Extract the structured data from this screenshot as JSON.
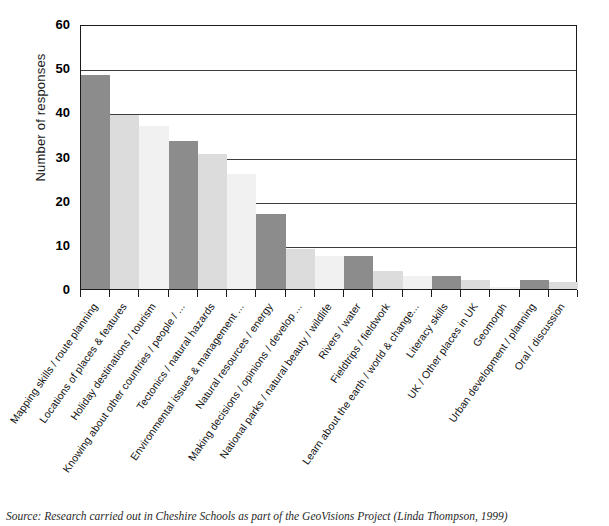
{
  "chart_data": {
    "type": "bar",
    "title": "",
    "xlabel": "",
    "ylabel": "Number of responses",
    "ylim": [
      0,
      60
    ],
    "yticks": [
      0,
      10,
      20,
      30,
      40,
      50,
      60
    ],
    "grid": true,
    "legend": null,
    "categories": [
      "Mapping skills / route planning",
      "Locations of places & features",
      "Holiday destinations / tourism",
      "Knowing about other countries / people / ...",
      "Tectonics / natural hazards",
      "Environmental issues & management ...",
      "Natural resources / energy",
      "Making decisions / opinions / develop ...",
      "National parks / natural beauty / wildlife",
      "Rivers / water",
      "Fieldtrips / fieldwork",
      "Learn about the earth / world & change...",
      "Literacy skills",
      "UK / Other places in UK",
      "Geomorph",
      "Urban development / planning",
      "Oral / discussion"
    ],
    "values": [
      48.5,
      39.5,
      37,
      33.5,
      30.5,
      26,
      17,
      9,
      7.5,
      7.5,
      4,
      3,
      3,
      2,
      0.5,
      2,
      1.5
    ],
    "bar_colors": [
      "#8c8c8c",
      "#dcdcdc",
      "#f1f1f1",
      "#8c8c8c",
      "#dcdcdc",
      "#f1f1f1",
      "#8c8c8c",
      "#dcdcdc",
      "#f1f1f1",
      "#8c8c8c",
      "#dcdcdc",
      "#f1f1f1",
      "#8c8c8c",
      "#dcdcdc",
      "#f1f1f1",
      "#8c8c8c",
      "#dcdcdc"
    ]
  },
  "caption": {
    "source": "Source: Research carried out in Cheshire Schools as part of the GeoVisions Project (Linda Thompson, 1999)"
  },
  "colors": {
    "axis": "#1b1b1b",
    "gridline": "#3d3d3d",
    "dark_bar": "#8c8c8c",
    "mid_bar": "#dcdcdc",
    "light_bar": "#f1f1f1",
    "background": "#ffffff"
  }
}
